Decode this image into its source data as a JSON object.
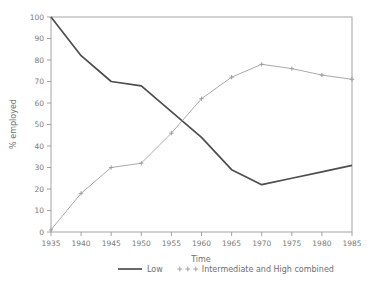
{
  "chart_data": {
    "type": "line",
    "title": "",
    "xlabel": "Time",
    "ylabel": "% employed",
    "xlim": [
      1935,
      1985
    ],
    "ylim": [
      0,
      100
    ],
    "grid": false,
    "legend_position": "bottom",
    "x": [
      1935,
      1940,
      1945,
      1950,
      1955,
      1960,
      1965,
      1970,
      1975,
      1980,
      1985
    ],
    "xticklabels": [
      "1935",
      "1940",
      "1945",
      "1950",
      "1955",
      "1960",
      "1965",
      "1970",
      "1975",
      "1980",
      "1985"
    ],
    "yticks": [
      0,
      10,
      20,
      30,
      40,
      50,
      60,
      70,
      80,
      90,
      100
    ],
    "yticklabels": [
      "0",
      "10",
      "20",
      "30",
      "40",
      "50",
      "60",
      "70",
      "80",
      "90",
      "100"
    ],
    "series": [
      {
        "name": "Low",
        "color": "#4d4d4d",
        "marker": "none",
        "values": [
          100,
          82,
          70,
          68,
          56,
          44,
          29,
          22,
          25,
          28,
          31
        ]
      },
      {
        "name": "Intermediate and High combined",
        "color": "#9a9a9a",
        "marker": "plus",
        "values": [
          1,
          18,
          30,
          32,
          46,
          62,
          72,
          78,
          76,
          73,
          71
        ]
      }
    ]
  },
  "legend": {
    "items": [
      {
        "label": "Low",
        "style": "solid-line"
      },
      {
        "label": "Intermediate and High combined",
        "style": "plus-markers"
      }
    ]
  },
  "colors": {
    "low_series": "#4d4d4d",
    "intermediate_series": "#9a9a9a",
    "axis": "#9a9a9a",
    "text": "#6f6f6f",
    "background": "#ffffff"
  }
}
